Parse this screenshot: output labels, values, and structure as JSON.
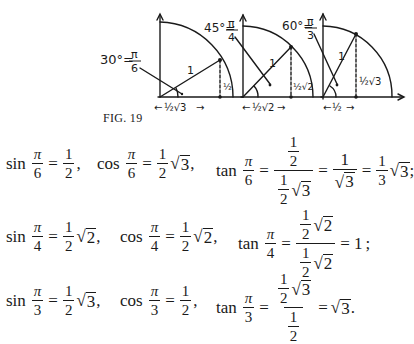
{
  "figure": {
    "caption": "FIG. 19",
    "panels": [
      {
        "angle_label": "30°=",
        "angle_num": "π",
        "angle_den": "6",
        "hyp": "1",
        "opp": "½",
        "adj": "½√3"
      },
      {
        "angle_label": "45°=",
        "angle_num": "π",
        "angle_den": "4",
        "hyp": "1",
        "opp": "½√2",
        "adj": "½√2"
      },
      {
        "angle_label": "60°=",
        "angle_num": "π",
        "angle_den": "3",
        "hyp": "1",
        "opp": "½√3",
        "adj": "½"
      }
    ]
  },
  "equations": {
    "row1": {
      "sin": {
        "fn": "sin",
        "arg_num": "π",
        "arg_den": "6",
        "eq": "=",
        "val_num": "1",
        "val_den": "2",
        "end": ","
      },
      "cos": {
        "fn": "cos",
        "arg_num": "π",
        "arg_den": "6",
        "eq": "=",
        "val_num": "1",
        "val_den": "2",
        "rad": "3",
        "end": ","
      },
      "tan": {
        "fn": "tan",
        "arg_num": "π",
        "arg_den": "6",
        "eq": "=",
        "big_num_num": "1",
        "big_num_den": "2",
        "big_den_num": "1",
        "big_den_den": "2",
        "big_den_rad": "3",
        "step2_num": "1",
        "step2_rad": "3",
        "step3_num": "1",
        "step3_den": "3",
        "step3_rad": "3",
        "end": ";"
      }
    },
    "row2": {
      "sin": {
        "fn": "sin",
        "arg_num": "π",
        "arg_den": "4",
        "eq": "=",
        "val_num": "1",
        "val_den": "2",
        "rad": "2",
        "end": ","
      },
      "cos": {
        "fn": "cos",
        "arg_num": "π",
        "arg_den": "4",
        "eq": "=",
        "val_num": "1",
        "val_den": "2",
        "rad": "2",
        "end": ","
      },
      "tan": {
        "fn": "tan",
        "arg_num": "π",
        "arg_den": "4",
        "eq": "=",
        "big_num_num": "1",
        "big_num_den": "2",
        "big_num_rad": "2",
        "big_den_num": "1",
        "big_den_den": "2",
        "big_den_rad": "2",
        "result": "= 1",
        "end": ";"
      }
    },
    "row3": {
      "sin": {
        "fn": "sin",
        "arg_num": "π",
        "arg_den": "3",
        "eq": "=",
        "val_num": "1",
        "val_den": "2",
        "rad": "3",
        "end": ","
      },
      "cos": {
        "fn": "cos",
        "arg_num": "π",
        "arg_den": "3",
        "eq": "=",
        "val_num": "1",
        "val_den": "2",
        "end": ","
      },
      "tan": {
        "fn": "tan",
        "arg_num": "π",
        "arg_den": "3",
        "eq": "=",
        "big_num_num": "1",
        "big_num_den": "2",
        "big_num_rad": "3",
        "big_den_num": "1",
        "big_den_den": "2",
        "result_eq": "=",
        "result_rad": "3",
        "end": "."
      }
    }
  }
}
